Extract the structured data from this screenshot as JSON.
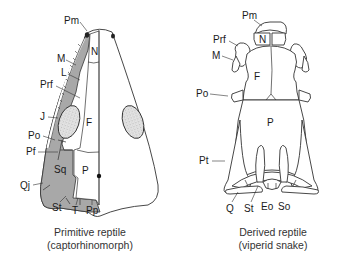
{
  "diagram": {
    "colors": {
      "lost_bones_shading": "#a8a8a8",
      "stipple": "#d8d8d8",
      "line": "#333333",
      "background": "#ffffff"
    },
    "left_skull": {
      "caption_line1": "Primitive reptile",
      "caption_line2": "(captorhinomorph)",
      "labels": {
        "Pm": "Pm",
        "N": "N",
        "M": "M",
        "L": "L",
        "Prf": "Prf",
        "J": "J",
        "F": "F",
        "Po": "Po",
        "Pf": "Pf",
        "Sq": "Sq",
        "P": "P",
        "Qj": "Qj",
        "St": "St",
        "T": "T",
        "Pp": "Pp"
      }
    },
    "right_skull": {
      "caption_line1": "Derived reptile",
      "caption_line2": "(viperid snake)",
      "labels": {
        "Pm": "Pm",
        "N": "N",
        "Prf": "Prf",
        "M": "M",
        "F": "F",
        "Po": "Po",
        "P": "P",
        "Pt": "Pt",
        "Q": "Q",
        "St": "St",
        "Eo": "Eo",
        "So": "So"
      }
    }
  }
}
